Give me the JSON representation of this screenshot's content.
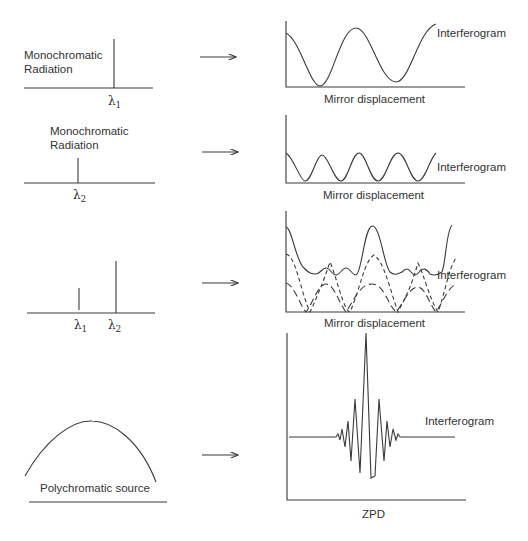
{
  "panels": [
    {
      "spectrum": {
        "label_line1": "Monochromatic",
        "label_line2": "Radiation",
        "lines": [
          {
            "symbol": "λ",
            "sub": "1"
          }
        ]
      },
      "interferogram": {
        "label": "Interferogram",
        "x_axis_label": "Mirror displacement"
      }
    },
    {
      "spectrum": {
        "label_line1": "Monochromatic",
        "label_line2": "Radiation",
        "lines": [
          {
            "symbol": "λ",
            "sub": "2"
          }
        ]
      },
      "interferogram": {
        "label": "Interferogram",
        "x_axis_label": "Mirror displacement"
      }
    },
    {
      "spectrum": {
        "lines": [
          {
            "symbol": "λ",
            "sub": "1"
          },
          {
            "symbol": "λ",
            "sub": "2"
          }
        ]
      },
      "interferogram": {
        "label": "Interferogram",
        "x_axis_label": "Mirror displacement"
      }
    },
    {
      "spectrum": {
        "label": "Polychromatic source"
      },
      "interferogram": {
        "label": "Interferogram",
        "x_axis_label": "ZPD"
      }
    }
  ],
  "colors": {
    "line": "#3a3a3a",
    "background": "#ffffff"
  }
}
